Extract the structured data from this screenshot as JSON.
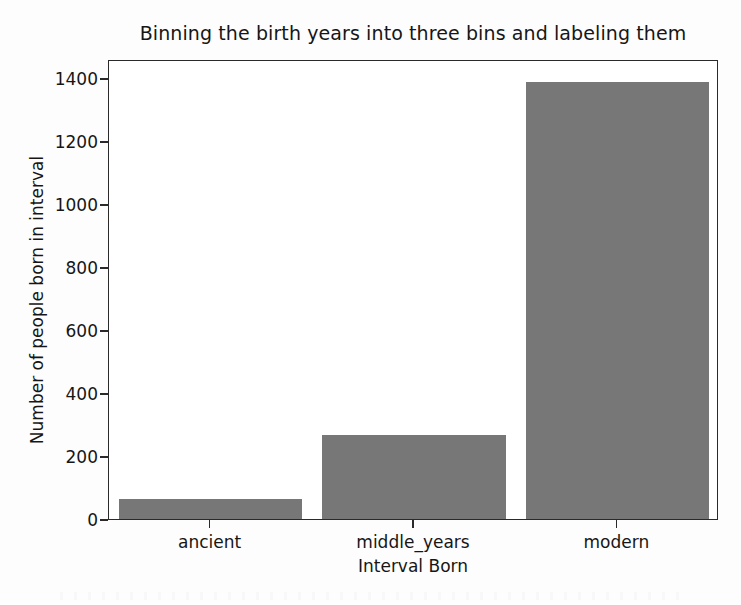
{
  "chart_data": {
    "type": "bar",
    "title": "Binning the birth years into three bins and labeling them",
    "xlabel": "Interval Born",
    "ylabel": "Number of people born in interval",
    "categories": [
      "ancient",
      "middle_years",
      "modern"
    ],
    "values": [
      62,
      268,
      1387
    ],
    "ylim": [
      0,
      1460
    ],
    "yticks": [
      0,
      200,
      400,
      600,
      800,
      1000,
      1200,
      1400
    ],
    "ytick_labels": [
      "0",
      "200",
      "400",
      "600",
      "800",
      "1000",
      "1200",
      "1400"
    ],
    "grid": false,
    "legend": null,
    "bar_color": "#777777",
    "axes_color": "#2a2a2a",
    "background_color": "#ffffff"
  }
}
